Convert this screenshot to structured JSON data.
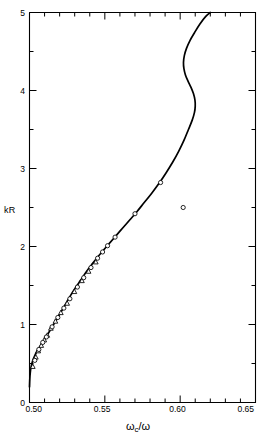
{
  "figure": {
    "ylabel": "kR",
    "xlabel_parts": {
      "omega": "ω",
      "sub": "c",
      "slash": "/",
      "omega2": "ω"
    },
    "xlabel": "ωc/ω"
  },
  "axes": {
    "x_ticklabels": [
      "0.50",
      "0.55",
      "0.60",
      "0.65"
    ],
    "y_ticklabels": [
      "0",
      "1",
      "2",
      "3",
      "4",
      "5"
    ]
  },
  "chart_data": {
    "type": "line",
    "title": "",
    "xlabel": "ωc/ω",
    "ylabel": "kR",
    "xlim": [
      0.5,
      0.65
    ],
    "ylim": [
      0,
      5
    ],
    "xticks": [
      0.5,
      0.55,
      0.6,
      0.65
    ],
    "xticks_minor": [
      0.51,
      0.52,
      0.53,
      0.54,
      0.56,
      0.57,
      0.58,
      0.59,
      0.61,
      0.62,
      0.63,
      0.64
    ],
    "yticks": [
      0,
      1,
      2,
      3,
      4,
      5
    ],
    "yticks_minor": [
      0.5,
      1.5,
      2.5,
      3.5,
      4.5
    ],
    "grid": false,
    "legend": "none",
    "series": [
      {
        "name": "theory",
        "type": "line",
        "marker": "none",
        "color": "#000000",
        "points": [
          [
            0.5,
            0.2
          ],
          [
            0.5002,
            0.3
          ],
          [
            0.5005,
            0.38
          ],
          [
            0.501,
            0.45
          ],
          [
            0.502,
            0.53
          ],
          [
            0.5035,
            0.6
          ],
          [
            0.505,
            0.66
          ],
          [
            0.507,
            0.72
          ],
          [
            0.509,
            0.78
          ],
          [
            0.511,
            0.84
          ],
          [
            0.5135,
            0.92
          ],
          [
            0.516,
            1.0
          ],
          [
            0.5185,
            1.08
          ],
          [
            0.5215,
            1.18
          ],
          [
            0.5245,
            1.28
          ],
          [
            0.5275,
            1.38
          ],
          [
            0.5305,
            1.47
          ],
          [
            0.534,
            1.57
          ],
          [
            0.5375,
            1.67
          ],
          [
            0.541,
            1.76
          ],
          [
            0.545,
            1.86
          ],
          [
            0.549,
            1.95
          ],
          [
            0.553,
            2.04
          ],
          [
            0.5575,
            2.14
          ],
          [
            0.562,
            2.24
          ],
          [
            0.5665,
            2.34
          ],
          [
            0.571,
            2.44
          ],
          [
            0.576,
            2.56
          ],
          [
            0.581,
            2.68
          ],
          [
            0.586,
            2.81
          ],
          [
            0.5905,
            2.94
          ],
          [
            0.595,
            3.08
          ],
          [
            0.599,
            3.22
          ],
          [
            0.6025,
            3.36
          ],
          [
            0.6055,
            3.5
          ],
          [
            0.608,
            3.62
          ],
          [
            0.6095,
            3.72
          ],
          [
            0.61,
            3.8
          ],
          [
            0.6098,
            3.88
          ],
          [
            0.6088,
            3.96
          ],
          [
            0.6072,
            4.04
          ],
          [
            0.6052,
            4.12
          ],
          [
            0.6035,
            4.2
          ],
          [
            0.6025,
            4.28
          ],
          [
            0.6022,
            4.36
          ],
          [
            0.6028,
            4.45
          ],
          [
            0.6042,
            4.54
          ],
          [
            0.6065,
            4.64
          ],
          [
            0.6095,
            4.74
          ],
          [
            0.613,
            4.85
          ],
          [
            0.617,
            4.95
          ],
          [
            0.62,
            5.0
          ]
        ]
      },
      {
        "name": "data-triangles",
        "type": "scatter",
        "marker": "triangle-open",
        "color": "#000000",
        "points": [
          [
            0.5022,
            0.46
          ],
          [
            0.5042,
            0.58
          ],
          [
            0.5058,
            0.66
          ],
          [
            0.5078,
            0.73
          ],
          [
            0.5098,
            0.8
          ],
          [
            0.5118,
            0.86
          ],
          [
            0.5142,
            0.95
          ],
          [
            0.5172,
            1.04
          ],
          [
            0.5208,
            1.15
          ],
          [
            0.525,
            1.27
          ],
          [
            0.5298,
            1.42
          ],
          [
            0.5348,
            1.56
          ],
          [
            0.5392,
            1.68
          ],
          [
            0.544,
            1.8
          ]
        ]
      },
      {
        "name": "data-circles",
        "type": "scatter",
        "marker": "circle-open",
        "color": "#000000",
        "points": [
          [
            0.5035,
            0.54
          ],
          [
            0.5062,
            0.68
          ],
          [
            0.5088,
            0.77
          ],
          [
            0.5112,
            0.84
          ],
          [
            0.515,
            0.97
          ],
          [
            0.5188,
            1.09
          ],
          [
            0.5228,
            1.21
          ],
          [
            0.5268,
            1.33
          ],
          [
            0.5318,
            1.48
          ],
          [
            0.536,
            1.6
          ],
          [
            0.5408,
            1.73
          ],
          [
            0.5452,
            1.85
          ],
          [
            0.5485,
            1.93
          ],
          [
            0.5518,
            2.01
          ],
          [
            0.5568,
            2.12
          ],
          [
            0.57,
            2.42
          ],
          [
            0.587,
            2.82
          ],
          [
            0.602,
            2.5
          ]
        ]
      }
    ]
  }
}
